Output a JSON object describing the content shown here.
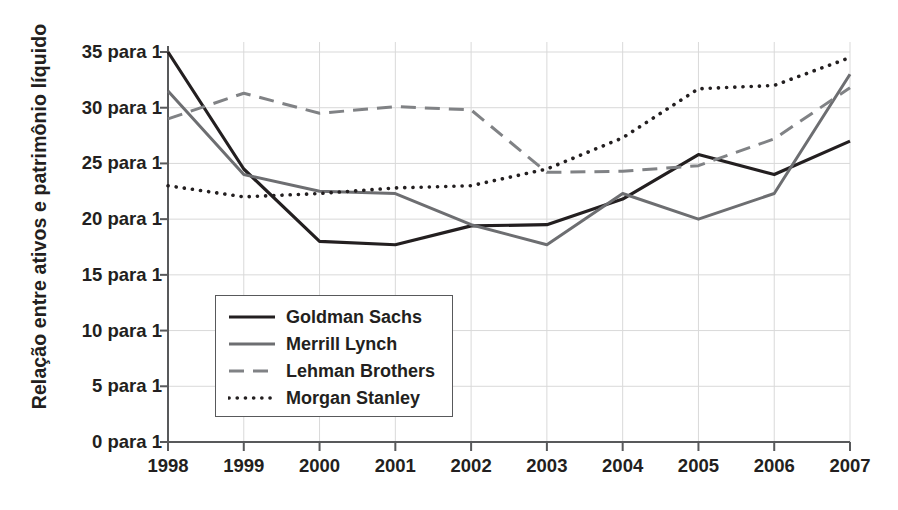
{
  "chart_data": {
    "type": "line",
    "title": "",
    "xlabel": "",
    "ylabel": "Relação entre ativos e patrimônio líquido",
    "x": [
      1998,
      1999,
      2000,
      2001,
      2002,
      2003,
      2004,
      2005,
      2006,
      2007
    ],
    "xticklabels": [
      "1998",
      "1999",
      "2000",
      "2001",
      "2002",
      "2003",
      "2004",
      "2005",
      "2006",
      "2007"
    ],
    "yticks": [
      0,
      5,
      10,
      15,
      20,
      25,
      30,
      35
    ],
    "yticklabels": [
      "0 para 1",
      "5 para 1",
      "10 para 1",
      "15 para 1",
      "20 para 1",
      "25 para 1",
      "30 para 1",
      "35 para 1"
    ],
    "ylim": [
      0,
      36.5
    ],
    "xlim": [
      1998,
      2007
    ],
    "grid": true,
    "legend_position": "lower-left-inside",
    "series": [
      {
        "name": "Goldman Sachs",
        "style": "solid",
        "color": "#231f20",
        "width": 3.2,
        "values": [
          35.0,
          24.5,
          18.0,
          17.7,
          19.4,
          19.5,
          21.8,
          25.8,
          24.0,
          27.0
        ]
      },
      {
        "name": "Merrill Lynch",
        "style": "solid",
        "color": "#6d6e71",
        "width": 3.0,
        "values": [
          31.5,
          24.0,
          22.5,
          22.3,
          19.5,
          17.7,
          22.3,
          20.0,
          22.3,
          33.0
        ]
      },
      {
        "name": "Lehman Brothers",
        "style": "dashed",
        "color": "#808285",
        "width": 3.0,
        "values": [
          29.0,
          31.3,
          29.5,
          30.1,
          29.8,
          24.2,
          24.3,
          24.8,
          27.2,
          31.8
        ]
      },
      {
        "name": "Morgan Stanley",
        "style": "dotted",
        "color": "#231f20",
        "width": 3.6,
        "values": [
          23.0,
          22.0,
          22.3,
          22.8,
          23.0,
          24.5,
          27.3,
          31.7,
          32.0,
          34.5
        ]
      }
    ]
  },
  "legend": {
    "items": [
      {
        "label": "Goldman Sachs"
      },
      {
        "label": "Merrill Lynch"
      },
      {
        "label": "Lehman Brothers"
      },
      {
        "label": "Morgan Stanley"
      }
    ]
  }
}
